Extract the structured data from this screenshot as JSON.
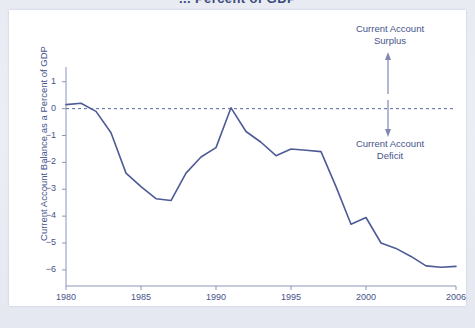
{
  "page": {
    "title_partial": "... Percent of GDP",
    "background_color": "#e8eaf2",
    "card_color": "#ffffff"
  },
  "colors": {
    "line": "#4d5b96",
    "text": "#46538a",
    "axis": "#8c95b8",
    "zero_line": "#5a67a0"
  },
  "annotations": {
    "surplus": "Current Account\nSurplus",
    "surplus_line1": "Current Account",
    "surplus_line2": "Surplus",
    "deficit_line1": "Current Account",
    "deficit_line2": "Deficit",
    "up_arrow_icon": "arrow-up-icon",
    "down_arrow_icon": "arrow-down-icon"
  },
  "chart_data": {
    "type": "line",
    "title": "Current Account Balance as a Percent of GDP",
    "xlabel": "",
    "ylabel": "Current Account Balance as a Percent of GDP",
    "xlim": [
      1980,
      2006
    ],
    "ylim": [
      -6.6,
      1.55
    ],
    "grid": false,
    "legend": null,
    "zero_reference_line": 0,
    "yticks": [
      1,
      0,
      -1,
      -2,
      -3,
      -4,
      -5,
      -6
    ],
    "ytick_labels": [
      "1",
      "0",
      "−1",
      "−2",
      "−3",
      "−4",
      "−5",
      "−6"
    ],
    "xticks": [
      1980,
      1985,
      1990,
      1995,
      2000,
      2006
    ],
    "xtick_labels": [
      "1980",
      "1985",
      "1990",
      "1995",
      "2000",
      "2006"
    ],
    "x": [
      1980,
      1981,
      1982,
      1983,
      1984,
      1985,
      1986,
      1987,
      1988,
      1989,
      1990,
      1991,
      1992,
      1993,
      1994,
      1995,
      1996,
      1997,
      1998,
      1999,
      2000,
      2001,
      2002,
      2003,
      2004,
      2005,
      2006
    ],
    "values": [
      0.15,
      0.2,
      -0.1,
      -0.9,
      -2.4,
      -2.9,
      -3.35,
      -3.42,
      -2.4,
      -1.8,
      -1.45,
      0.03,
      -0.85,
      -1.25,
      -1.75,
      -1.5,
      -1.55,
      -1.6,
      -2.9,
      -4.3,
      -4.05,
      -5.0,
      -5.2,
      -5.5,
      -5.85,
      -5.9,
      -5.87
    ],
    "series": [
      {
        "name": "Current Account Balance as a Percent of GDP",
        "values": [
          0.15,
          0.2,
          -0.1,
          -0.9,
          -2.4,
          -2.9,
          -3.35,
          -3.42,
          -2.4,
          -1.8,
          -1.45,
          0.03,
          -0.85,
          -1.25,
          -1.75,
          -1.5,
          -1.55,
          -1.6,
          -2.9,
          -4.3,
          -4.05,
          -5.0,
          -5.2,
          -5.5,
          -5.85,
          -5.9,
          -5.87
        ]
      }
    ]
  }
}
